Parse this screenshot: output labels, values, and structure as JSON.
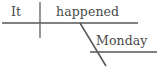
{
  "diagram": {
    "type": "sentence-diagram",
    "style": "reed-kellogg",
    "sentence": "It happened Monday.",
    "background_color": "#ffffff",
    "line_color": "#565656",
    "text_color": "#4a4a4a",
    "subject": {
      "label": "It",
      "role": "subject"
    },
    "predicate": {
      "label": "happened",
      "role": "verb"
    },
    "modifier": {
      "label": "Monday",
      "role": "adverb-modifier"
    },
    "lines": {
      "baseline": {
        "x1": 2,
        "y1": 23,
        "x2": 138,
        "y2": 23
      },
      "subject_verb_divider": {
        "x1": 40,
        "y1": 2,
        "x2": 40,
        "y2": 38
      },
      "modifier_slant": {
        "x1": 80,
        "y1": 23,
        "x2": 106,
        "y2": 66
      },
      "modifier_baseline": {
        "x1": 90,
        "y1": 52,
        "x2": 157,
        "y2": 52
      }
    }
  }
}
